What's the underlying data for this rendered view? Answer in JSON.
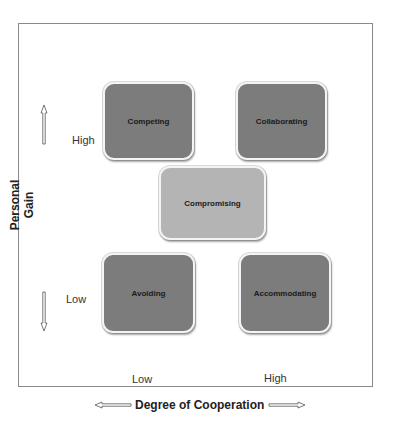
{
  "diagram": {
    "y_axis": {
      "label": "Personal Gain",
      "high_label": "High",
      "low_label": "Low"
    },
    "x_axis": {
      "label": "Degree of Cooperation",
      "low_label": "Low",
      "high_label": "High"
    },
    "boxes": [
      {
        "label": "Competing",
        "position": "high gain / low cooperation",
        "shade": "dark",
        "color": "#7c7c7c"
      },
      {
        "label": "Collaborating",
        "position": "high gain / high cooperation",
        "shade": "dark",
        "color": "#7c7c7c"
      },
      {
        "label": "Compromising",
        "position": "center",
        "shade": "light",
        "color": "#b4b4b4"
      },
      {
        "label": "Avoiding",
        "position": "low gain / low cooperation",
        "shade": "dark",
        "color": "#7c7c7c"
      },
      {
        "label": "Accommodating",
        "position": "low gain / high cooperation",
        "shade": "dark",
        "color": "#7c7c7c"
      }
    ],
    "icons": {
      "up_arrow": "arrow-up-icon",
      "down_arrow": "arrow-down-icon",
      "left_arrow": "arrow-left-icon",
      "right_arrow": "arrow-right-icon"
    }
  }
}
